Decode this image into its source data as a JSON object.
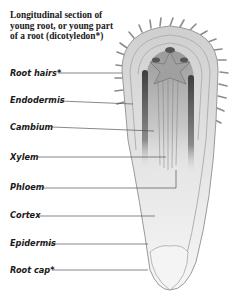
{
  "figure": {
    "title_lines": [
      "Longitudinal section of",
      "young root, or young part",
      "of a root (dicotyledon*)"
    ],
    "labels": [
      {
        "id": "root-hairs",
        "text": "Root hairs*",
        "y": 73
      },
      {
        "id": "endodermis",
        "text": "Endodermis",
        "y": 100
      },
      {
        "id": "cambium",
        "text": "Cambium",
        "y": 127
      },
      {
        "id": "xylem",
        "text": "Xylem",
        "y": 157
      },
      {
        "id": "phloem",
        "text": "Phloem",
        "y": 187
      },
      {
        "id": "cortex",
        "text": "Cortex",
        "y": 215
      },
      {
        "id": "epidermis",
        "text": "Epidermis",
        "y": 243
      },
      {
        "id": "root-cap",
        "text": "Root cap*",
        "y": 270
      }
    ],
    "colors": {
      "text": "#1a1a1a",
      "leader_line": "#555555",
      "outline": "#9a9a9a",
      "vascular_dark": "#4a4a4a",
      "tissue_light": "#e4e4e4"
    }
  }
}
